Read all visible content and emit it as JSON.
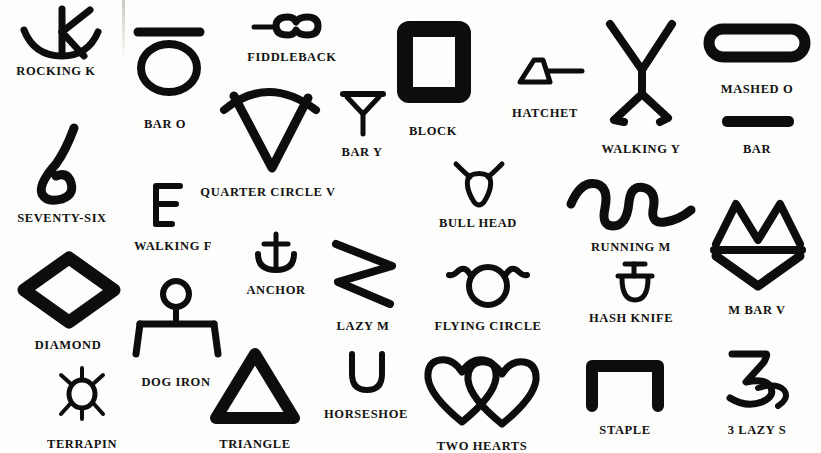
{
  "page": {
    "background_color": "#fdfdfb",
    "ink_color": "#0d0d0d",
    "width": 821,
    "height": 453
  },
  "brands": [
    {
      "id": "rocking-k",
      "label": "ROCKING K",
      "icon": "rocking-k-brand-icon",
      "caption_x": 56,
      "caption_y": 64
    },
    {
      "id": "bar-o",
      "label": "BAR O",
      "icon": "bar-o-brand-icon",
      "caption_x": 165,
      "caption_y": 117
    },
    {
      "id": "fiddleback",
      "label": "FIDDLEBACK",
      "icon": "fiddleback-brand-icon",
      "caption_x": 292,
      "caption_y": 50
    },
    {
      "id": "quarter-circle-v",
      "label": "QUARTER CIRCLE V",
      "icon": "quarter-circle-v-brand-icon",
      "caption_x": 268,
      "caption_y": 185
    },
    {
      "id": "bar-y",
      "label": "BAR Y",
      "icon": "bar-y-brand-icon",
      "caption_x": 362,
      "caption_y": 145
    },
    {
      "id": "block",
      "label": "BLOCK",
      "icon": "block-brand-icon",
      "caption_x": 433,
      "caption_y": 124
    },
    {
      "id": "hatchet",
      "label": "HATCHET",
      "icon": "hatchet-brand-icon",
      "caption_x": 545,
      "caption_y": 106
    },
    {
      "id": "walking-y",
      "label": "WALKING Y",
      "icon": "walking-y-brand-icon",
      "caption_x": 641,
      "caption_y": 142
    },
    {
      "id": "mashed-o",
      "label": "MASHED O",
      "icon": "mashed-o-brand-icon",
      "caption_x": 757,
      "caption_y": 82
    },
    {
      "id": "bar",
      "label": "BAR",
      "icon": "bar-brand-icon",
      "caption_x": 757,
      "caption_y": 142
    },
    {
      "id": "seventy-six",
      "label": "SEVENTY-SIX",
      "icon": "seventy-six-brand-icon",
      "caption_x": 62,
      "caption_y": 211
    },
    {
      "id": "walking-f",
      "label": "WALKING F",
      "icon": "walking-f-brand-icon",
      "caption_x": 173,
      "caption_y": 239
    },
    {
      "id": "anchor",
      "label": "ANCHOR",
      "icon": "anchor-brand-icon",
      "caption_x": 276,
      "caption_y": 283
    },
    {
      "id": "bull-head",
      "label": "BULL HEAD",
      "icon": "bull-head-brand-icon",
      "caption_x": 478,
      "caption_y": 216
    },
    {
      "id": "lazy-m",
      "label": "LAZY M",
      "icon": "lazy-m-brand-icon",
      "caption_x": 363,
      "caption_y": 319
    },
    {
      "id": "flying-circle",
      "label": "FLYING CIRCLE",
      "icon": "flying-circle-brand-icon",
      "caption_x": 488,
      "caption_y": 319
    },
    {
      "id": "running-m",
      "label": "RUNNING M",
      "icon": "running-m-brand-icon",
      "caption_x": 631,
      "caption_y": 240
    },
    {
      "id": "hash-knife",
      "label": "HASH KNIFE",
      "icon": "hash-knife-brand-icon",
      "caption_x": 631,
      "caption_y": 311
    },
    {
      "id": "m-bar-v",
      "label": "M BAR V",
      "icon": "m-bar-v-brand-icon",
      "caption_x": 757,
      "caption_y": 303
    },
    {
      "id": "diamond",
      "label": "DIAMOND",
      "icon": "diamond-brand-icon",
      "caption_x": 68,
      "caption_y": 338
    },
    {
      "id": "dog-iron",
      "label": "DOG IRON",
      "icon": "dog-iron-brand-icon",
      "caption_x": 176,
      "caption_y": 375
    },
    {
      "id": "terrapin",
      "label": "TERRAPIN",
      "icon": "terrapin-brand-icon",
      "caption_x": 82,
      "caption_y": 437
    },
    {
      "id": "triangle",
      "label": "TRIANGLE",
      "icon": "triangle-brand-icon",
      "caption_x": 255,
      "caption_y": 437
    },
    {
      "id": "horseshoe",
      "label": "HORSESHOE",
      "icon": "horseshoe-brand-icon",
      "caption_x": 366,
      "caption_y": 407
    },
    {
      "id": "two-hearts",
      "label": "TWO HEARTS",
      "icon": "two-hearts-brand-icon",
      "caption_x": 482,
      "caption_y": 439
    },
    {
      "id": "staple",
      "label": "STAPLE",
      "icon": "staple-brand-icon",
      "caption_x": 625,
      "caption_y": 423
    },
    {
      "id": "3-lazy-s",
      "label": "3 LAZY S",
      "icon": "three-lazy-s-brand-icon",
      "caption_x": 757,
      "caption_y": 423
    }
  ]
}
